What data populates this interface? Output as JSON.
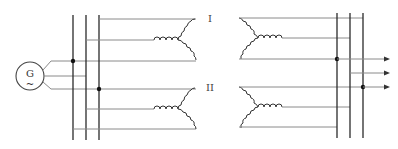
{
  "diagram": {
    "type": "electrical-schematic",
    "generator": {
      "label": "G",
      "symbol": "~"
    },
    "transformers": [
      {
        "label": "I"
      },
      {
        "label": "II"
      }
    ],
    "outputs": {
      "count": 3,
      "arrow": "→"
    },
    "colors": {
      "bus": "#2a2a2a",
      "wire": "#8a8a8a",
      "coil": "#333333"
    }
  }
}
